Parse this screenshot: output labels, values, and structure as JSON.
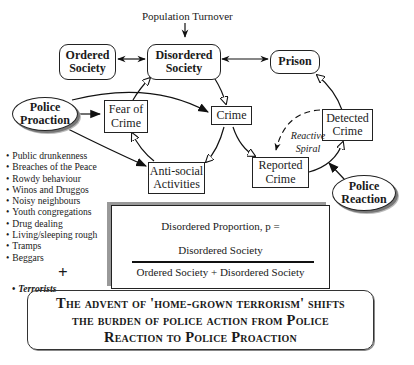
{
  "diagram": {
    "top_label": "Population Turnover",
    "nodes": {
      "ordered_society": "Ordered Society",
      "disordered_society": "Disordered Society",
      "prison": "Prison",
      "police_proaction": "Police Proaction",
      "fear_of_crime": "Fear of Crime",
      "crime": "Crime",
      "detected_crime": "Detected Crime",
      "reported_crime": "Reported Crime",
      "anti_social_activities": "Anti-social Activities",
      "police_reaction": "Police Reaction"
    },
    "reactive_spiral_label": "Reactive Spiral",
    "anti_social_examples": [
      "Public drunkenness",
      "Breaches of the Peace",
      "Rowdy behaviour",
      "Winos and Druggos",
      "Noisy neighbours",
      "Youth congregations",
      "Drug dealing",
      "Living/sleeping rough",
      "Tramps",
      "Beggars"
    ],
    "plus_sign": "+",
    "terrorists_item": "Terrorists"
  },
  "formula": {
    "lhs": "Disordered Proportion, p =",
    "numerator": "Disordered Society",
    "denominator": "Ordered Society +  Disordered Society"
  },
  "banner": {
    "lines": [
      "The advent of 'home-grown terrorism' shifts",
      "the burden of police action from Police",
      "Reaction to Police Proaction"
    ]
  }
}
